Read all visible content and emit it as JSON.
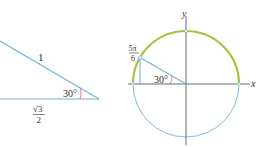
{
  "triangle": {
    "hypotenuse_label": "1",
    "angle_label": "30°",
    "base_numerator": "√3",
    "base_denominator": "2"
  },
  "unit_circle": {
    "y_axis_label": "y",
    "x_axis_label": "x",
    "point_numerator": "5π",
    "point_denominator": "6",
    "angle_label": "30°"
  },
  "colors": {
    "line_blue": "#6fb4d6",
    "arc_green": "#a9c23f",
    "axis": "#444444",
    "angle_mark": "#e05a5a"
  }
}
